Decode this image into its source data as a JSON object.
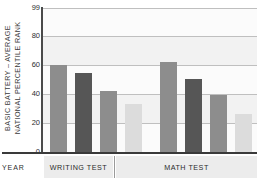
{
  "chart_data": {
    "type": "bar",
    "title": "",
    "xlabel": "YEAR",
    "ylabel": "BASIC BATTERY – AVERAGE NATIONAL PERCENTILE RANK",
    "ylabel_lines": [
      "BASIC BATTERY – AVERAGE",
      "NATIONAL PERCENTILE RANK"
    ],
    "ylim": [
      0,
      99
    ],
    "yticks": [
      0,
      20,
      40,
      60,
      80,
      99
    ],
    "ytick_labels": [
      "0",
      "20",
      "40",
      "60",
      "80",
      "99"
    ],
    "grid": true,
    "legend": "none",
    "categories": [
      "WRITING TEST",
      "MATH TEST"
    ],
    "groups": [
      {
        "label": "WRITING TEST",
        "bars": [
          {
            "value": 60,
            "color": "#8d8d8d"
          },
          {
            "value": 54,
            "color": "#565656"
          },
          {
            "value": 42,
            "color": "#8d8d8d"
          },
          {
            "value": 33,
            "color": "#dcdcdc"
          }
        ]
      },
      {
        "label": "MATH TEST",
        "bars": [
          {
            "value": 62,
            "color": "#8d8d8d"
          },
          {
            "value": 50,
            "color": "#565656"
          },
          {
            "value": 39,
            "color": "#8d8d8d"
          },
          {
            "value": 26,
            "color": "#dcdcdc"
          }
        ]
      }
    ],
    "series": [
      {
        "name": "bar-1",
        "values": [
          60,
          62
        ]
      },
      {
        "name": "bar-2",
        "values": [
          54,
          50
        ]
      },
      {
        "name": "bar-3",
        "values": [
          42,
          39
        ]
      },
      {
        "name": "bar-4",
        "values": [
          33,
          26
        ]
      }
    ],
    "colors": {
      "bar_medium": "#8d8d8d",
      "bar_dark": "#565656",
      "bar_light": "#dcdcdc",
      "plot_background": "#f2f2f2",
      "band_background": "#fbfbfb",
      "gridline": "#bfbfbf",
      "axis": "#3a3a3a",
      "footer_band": "#ececec"
    }
  },
  "footer": {
    "year_label": "YEAR"
  }
}
